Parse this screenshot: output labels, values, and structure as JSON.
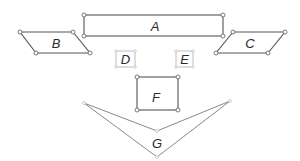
{
  "diagram": {
    "title": "",
    "shapes": [
      {
        "id": "A",
        "label": "A",
        "type": "rectangle"
      },
      {
        "id": "B",
        "label": "B",
        "type": "parallelogram"
      },
      {
        "id": "C",
        "label": "C",
        "type": "parallelogram"
      },
      {
        "id": "D",
        "label": "D",
        "type": "small-square"
      },
      {
        "id": "E",
        "label": "E",
        "type": "small-square"
      },
      {
        "id": "F",
        "label": "F",
        "type": "square"
      },
      {
        "id": "G",
        "label": "G",
        "type": "concave-quadrilateral"
      }
    ],
    "colors": {
      "stroke": "#555555",
      "vertex_fill": "#ffffff",
      "label": "#2a2a2a"
    }
  }
}
